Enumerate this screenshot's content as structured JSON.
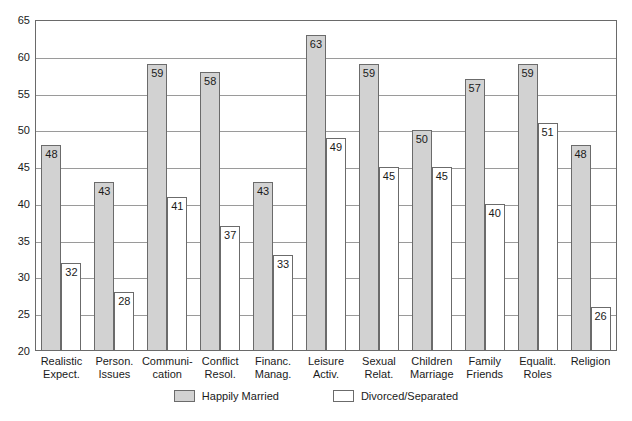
{
  "chart_data": {
    "type": "bar",
    "title": "",
    "xlabel": "",
    "ylabel": "",
    "ylim": [
      20,
      65
    ],
    "yticks": [
      20,
      25,
      30,
      35,
      40,
      45,
      50,
      55,
      60,
      65
    ],
    "grid": true,
    "legend_position": "bottom",
    "categories": [
      "Realistic Expect.",
      "Person. Issues",
      "Communi-cation",
      "Conflict Resol.",
      "Financ. Manag.",
      "Leisure Activ.",
      "Sexual Relat.",
      "Children Marriage",
      "Family Friends",
      "Equalit. Roles",
      "Religion"
    ],
    "category_lines": [
      [
        "Realistic",
        "Expect."
      ],
      [
        "Person.",
        "Issues"
      ],
      [
        "Communi-",
        "cation"
      ],
      [
        "Conflict",
        "Resol."
      ],
      [
        "Financ.",
        "Manag."
      ],
      [
        "Leisure",
        "Activ."
      ],
      [
        "Sexual",
        "Relat."
      ],
      [
        "Children",
        "Marriage"
      ],
      [
        "Family",
        "Friends"
      ],
      [
        "Equalit.",
        "Roles"
      ],
      [
        "Religion",
        ""
      ]
    ],
    "series": [
      {
        "name": "Happily Married",
        "color": "#d2d2d2",
        "values": [
          48,
          43,
          59,
          58,
          43,
          63,
          59,
          50,
          57,
          59,
          48
        ]
      },
      {
        "name": "Divorced/Separated",
        "color": "#ffffff",
        "values": [
          32,
          28,
          41,
          37,
          33,
          49,
          45,
          45,
          40,
          51,
          26
        ]
      }
    ]
  },
  "legend": {
    "items": [
      {
        "label": "Happily Married"
      },
      {
        "label": "Divorced/Separated"
      }
    ]
  }
}
